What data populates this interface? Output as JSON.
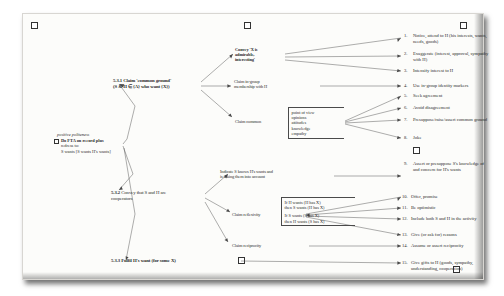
{
  "figure": {
    "root": {
      "header": "positive politeness",
      "lines": [
        "Do FTA on record plus",
        "redress to:",
        "S wants [S wants H's wants]"
      ],
      "checkbox_icon": "checkbox-icon"
    },
    "branches": [
      {
        "id": "5.3.1",
        "number": "5.3.1",
        "label": "Claim 'common ground'",
        "sublabel": "(S & H ∈ {A} who want {X})"
      },
      {
        "id": "5.3.2",
        "number": "5.3.2",
        "label": "Convey that S and H are",
        "sublabel": "cooperators"
      },
      {
        "id": "5.3.3",
        "number": "5.3.3",
        "label": "Fulfil H's want (for some X)",
        "sublabel": ""
      }
    ],
    "mid_nodes": [
      {
        "id": "convey-x-admirable",
        "lines": [
          "Convey 'X is",
          "admirable,",
          "interesting'"
        ]
      },
      {
        "id": "claim-ingroup-membership",
        "lines": [
          "Claim in-group",
          "membership with H"
        ]
      },
      {
        "id": "claim-common",
        "lines": [
          "Claim common"
        ]
      },
      {
        "id": "indicate-s-knows-h-wants",
        "lines": [
          "Indicate S knows H's wants and",
          "is taking them into account"
        ]
      },
      {
        "id": "claim-reflexivity",
        "lines": [
          "Claim reflexivity"
        ]
      },
      {
        "id": "claim-reciprocity",
        "lines": [
          "Claim reciprocity"
        ]
      }
    ],
    "brackets": [
      {
        "id": "claim-common-bracket",
        "items": [
          "point of view",
          "opinions",
          "attitudes",
          "knowledge",
          "empathy"
        ]
      },
      {
        "id": "claim-reflexivity-bracket",
        "group_a": [
          "If H wants (H has X)",
          "then S wants (H has X)"
        ],
        "group_b": [
          "If S wants (S has X)",
          "then H wants (S has X)"
        ]
      }
    ],
    "strategies": [
      {
        "num": "1.",
        "text": "Notice, attend to H (his interests, wants, needs, goods)"
      },
      {
        "num": "2.",
        "text": "Exaggerate (interest, approval, sympathy with H)"
      },
      {
        "num": "3.",
        "text": "Intensify interest to H"
      },
      {
        "num": "4.",
        "text": "Use in-group identity markers"
      },
      {
        "num": "5.",
        "text": "Seek agreement"
      },
      {
        "num": "6.",
        "text": "Avoid disagreement"
      },
      {
        "num": "7.",
        "text": "Presuppose/raise/assert common ground"
      },
      {
        "num": "8.",
        "text": "Joke"
      },
      {
        "num": "9.",
        "text": "Assert or presuppose S's knowledge of and concern for H's wants"
      },
      {
        "num": "10.",
        "text": "Offer, promise"
      },
      {
        "num": "11.",
        "text": "Be optimistic"
      },
      {
        "num": "12.",
        "text": "Include both S and H in the activity"
      },
      {
        "num": "13.",
        "text": "Give (or ask for) reasons"
      },
      {
        "num": "14.",
        "text": "Assume or assert reciprocity"
      },
      {
        "num": "15.",
        "text": "Give gifts to H (goods, sympathy, understanding, cooperation)"
      }
    ]
  },
  "colors": {
    "ink": "#2b2b2b",
    "line": "#4a4a4a",
    "paper": "#fcfcfa",
    "backdrop": "#ffffff"
  }
}
